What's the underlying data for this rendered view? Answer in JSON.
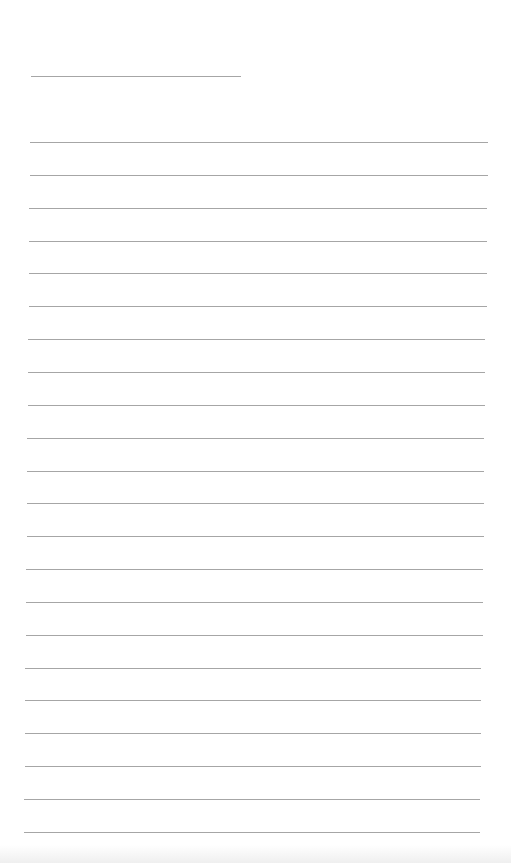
{
  "page": {
    "type": "lined-paper",
    "background_color": "#ffffff",
    "line_color": "#a6a6a6",
    "title_line": {
      "x": 31,
      "y": 76,
      "width": 210
    },
    "ruled_lines": {
      "count": 22,
      "first_y": 142,
      "spacing": 32.85,
      "x_start_top": 30,
      "x_end_top": 488,
      "x_start_bottom": 24,
      "x_end_bottom": 480
    },
    "text_content": []
  }
}
